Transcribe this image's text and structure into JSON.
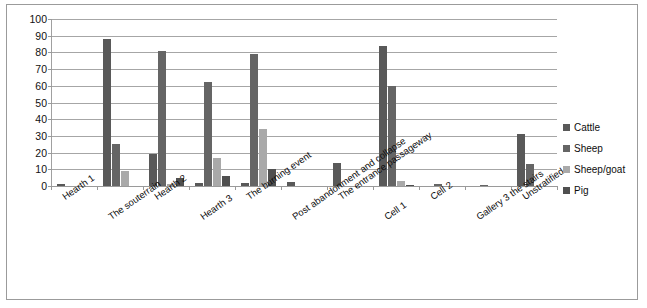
{
  "chart_data": {
    "type": "bar",
    "title": "",
    "subtitle": "",
    "xlabel": "",
    "ylabel": "",
    "ylim": [
      0,
      100
    ],
    "ytick_step": 10,
    "yticks": [
      100,
      90,
      80,
      70,
      60,
      50,
      40,
      30,
      20,
      10,
      0
    ],
    "grid": true,
    "legend_position": "right",
    "categories": [
      "Hearth 1",
      "The souterrain",
      "Hearth 2",
      "Hearth 3",
      "The burning event",
      "Post abandonment and collapse",
      "The entrance passageway",
      "Cell 1",
      "Cell 2",
      "Gallery 3 the stairs",
      "Unstratified"
    ],
    "series": [
      {
        "name": "Cattle",
        "color": "#595959",
        "values": [
          1,
          88,
          19,
          2,
          2,
          2.5,
          14,
          84,
          0,
          0,
          31
        ]
      },
      {
        "name": "Sheep",
        "color": "#656565",
        "values": [
          0,
          25,
          81,
          62.5,
          79,
          0,
          0,
          60,
          1,
          0.5,
          13
        ]
      },
      {
        "name": "Sheep/goat",
        "color": "#a9a9a9",
        "values": [
          0,
          9,
          1.5,
          17,
          34,
          0,
          0,
          3,
          0,
          0,
          0
        ]
      },
      {
        "name": "Pig",
        "color": "#4f4f4f",
        "values": [
          0,
          0,
          5,
          6,
          10,
          0,
          0,
          0.5,
          0,
          0,
          0
        ]
      }
    ]
  },
  "legend": {
    "items": [
      {
        "label": "Cattle",
        "color": "#595959"
      },
      {
        "label": "Sheep",
        "color": "#656565"
      },
      {
        "label": "Sheep/goat",
        "color": "#a9a9a9"
      },
      {
        "label": "Pig",
        "color": "#4f4f4f"
      }
    ]
  },
  "colors": {
    "frame_border": "#9b9b9b",
    "gridline": "#a6a6a6",
    "axis": "#9a9a9a",
    "text": "#0d0d0d",
    "background": "#ffffff"
  }
}
